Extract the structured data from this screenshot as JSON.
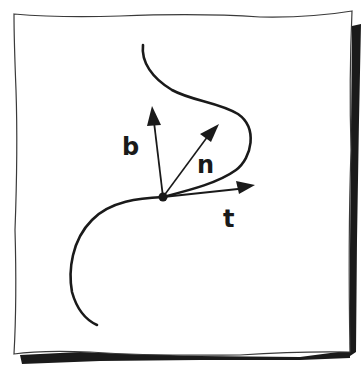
{
  "figure": {
    "type": "hand-drawn diagram",
    "colors": {
      "ink": "#1a1a1a",
      "paper": "#ffffff",
      "shadow": "#1a1a1a"
    }
  },
  "labels": {
    "binormal": "b",
    "normal": "n",
    "tangent": "t"
  },
  "vectors": [
    {
      "name": "b",
      "from": [
        163,
        197
      ],
      "to": [
        152,
        107
      ]
    },
    {
      "name": "n",
      "from": [
        163,
        197
      ],
      "to": [
        218,
        125
      ]
    },
    {
      "name": "t",
      "from": [
        163,
        197
      ],
      "to": [
        254,
        186
      ]
    }
  ],
  "point": {
    "x": 163,
    "y": 197
  }
}
